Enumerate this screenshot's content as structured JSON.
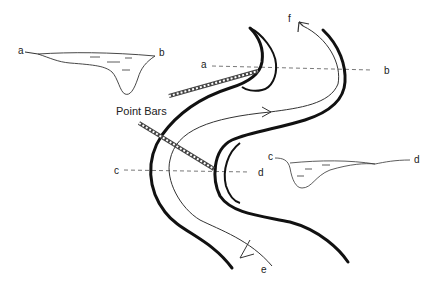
{
  "diagram": {
    "labels": {
      "point_bars": "Point Bars",
      "xs_ab_left_a": "a",
      "xs_ab_left_b": "b",
      "line_ab_a": "a",
      "line_ab_b": "b",
      "line_cd_c": "c",
      "line_cd_d": "d",
      "xs_cd_c": "c",
      "xs_cd_d": "d",
      "flow_start": "e",
      "flow_end": "f"
    },
    "colors": {
      "bank": "#111111",
      "thin_line": "#333333",
      "dashed": "#555555",
      "background": "#ffffff"
    }
  }
}
